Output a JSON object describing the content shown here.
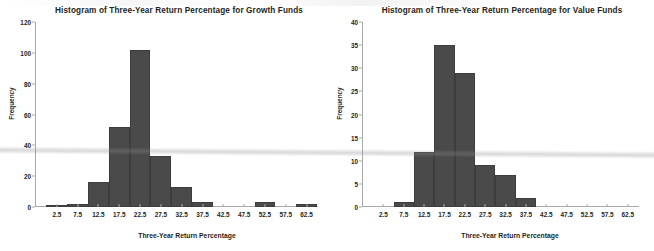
{
  "figure": {
    "background": "#ffffff",
    "bar_color": "#4a4a4a",
    "axis_color": "#a9a9a9",
    "text_color": "#231f20"
  },
  "chart_data": [
    {
      "type": "bar",
      "title": "Histogram of Three-Year Return Percentage for Growth Funds",
      "xlabel": "Three-Year Return Percentage",
      "ylabel": "Frequency",
      "categories": [
        "2.5",
        "7.5",
        "12.5",
        "17.5",
        "22.5",
        "27.5",
        "32.5",
        "37.5",
        "42.5",
        "47.5",
        "52.5",
        "57.5",
        "62.5"
      ],
      "values": [
        1,
        2,
        16,
        52,
        102,
        33,
        13,
        3,
        0,
        0,
        3,
        0,
        2
      ],
      "ylim": [
        0,
        120
      ],
      "yticks": [
        0,
        20,
        40,
        60,
        80,
        100,
        120
      ],
      "xlim": [
        0,
        65
      ],
      "grid": false,
      "legend": "none"
    },
    {
      "type": "bar",
      "title": "Histogram of Three-Year Return Percentage for Value Funds",
      "xlabel": "Three-Year Return Percentage",
      "ylabel": "Frequency",
      "categories": [
        "2.5",
        "7.5",
        "12.5",
        "17.5",
        "22.5",
        "27.5",
        "32.5",
        "37.5",
        "42.5",
        "47.5",
        "52.5",
        "57.5",
        "62.5"
      ],
      "values": [
        0,
        1,
        12,
        35,
        29,
        9,
        7,
        2,
        0,
        0,
        0,
        0,
        0
      ],
      "ylim": [
        0,
        40
      ],
      "yticks": [
        0,
        5,
        10,
        15,
        20,
        25,
        30,
        35,
        40
      ],
      "xlim": [
        0,
        65
      ],
      "grid": false,
      "legend": "none"
    }
  ]
}
